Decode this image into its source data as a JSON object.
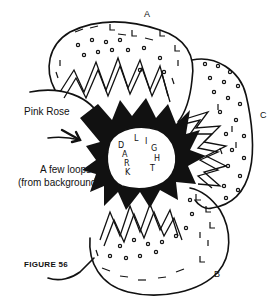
{
  "figure": {
    "caption": "FIGURE 56",
    "labels": {
      "petal_a": "A",
      "petal_b": "B",
      "petal_c": "C",
      "pink_rose": "Pink Rose",
      "loops_line1": "A few loops",
      "loops_line2": "(from background)"
    },
    "center_words": {
      "dark": [
        "D",
        "A",
        "R",
        "K"
      ],
      "light": [
        "L",
        "I",
        "G",
        "H",
        "T"
      ]
    },
    "colors": {
      "ink": "#111111",
      "paper": "#ffffff"
    }
  }
}
